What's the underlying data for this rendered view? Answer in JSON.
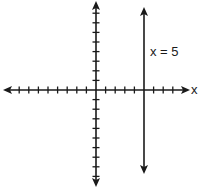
{
  "diagram": {
    "title": "",
    "x_axis_label": "x",
    "line_label": "x = 5",
    "line": {
      "type": "vertical",
      "x": 5
    },
    "x_ticks_negative": 8,
    "x_ticks_positive": 8,
    "y_ticks_positive": 8,
    "y_ticks_negative": 9,
    "x_range": [
      -9,
      9
    ],
    "y_range": [
      -10,
      9
    ],
    "colors": {
      "ink": "#1a1a1a",
      "background": "#ffffff"
    }
  }
}
